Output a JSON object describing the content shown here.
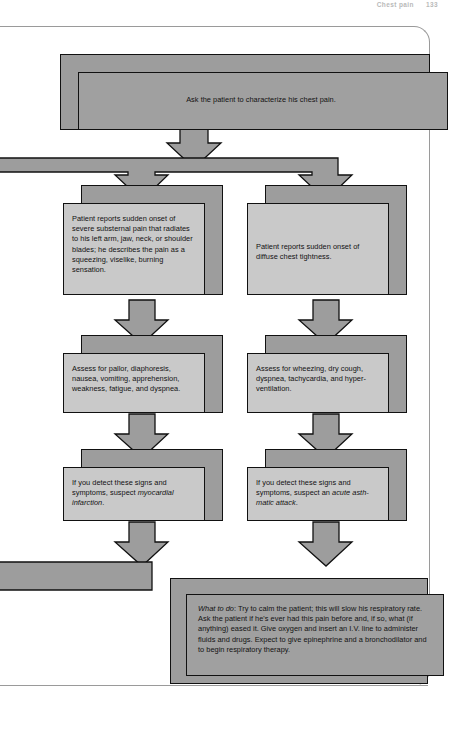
{
  "header": {
    "title": "Chest pain",
    "page_number": "133"
  },
  "flowchart": {
    "type": "decision-flowchart",
    "title": "Chest pain assessment flowchart",
    "nodes": [
      {
        "id": "start",
        "role": "start",
        "column": "full",
        "text": "Ask the patient to characterize his chest pain."
      },
      {
        "id": "left-1",
        "role": "branch-report",
        "column": "left",
        "text": "Patient reports sudden onset of severe substernal pain that radiates to his left arm, jaw, neck, or shoulder blades; he describes the pain as a squeezing, viselike, burning sensation."
      },
      {
        "id": "right-1",
        "role": "branch-report",
        "column": "right",
        "text": "Patient reports sudden onset of diffuse chest tightness."
      },
      {
        "id": "left-2",
        "role": "assess",
        "column": "left",
        "text": "Assess for pallor, diaphoresis, nausea, vomiting, apprehension, weakness, fatigue, and dyspnea."
      },
      {
        "id": "right-2",
        "role": "assess",
        "column": "right",
        "text": "Assess for wheezing, dry cough, dyspnea, tachycardia, and hyper-ventilation."
      },
      {
        "id": "left-3",
        "role": "suspect",
        "column": "left",
        "text_before": "If you detect these signs and symptoms, suspect ",
        "text_italic": "myocardial infarction",
        "text_after": "."
      },
      {
        "id": "right-3",
        "role": "suspect",
        "column": "right",
        "text_before": "If you detect these signs and symptoms, suspect an ",
        "text_italic": "acute asth-matic attack",
        "text_after": "."
      },
      {
        "id": "what-to-do",
        "role": "action",
        "column": "right",
        "text_italic": "What to do",
        "text_after": ": Try to calm the patient; this will slow his respiratory rate. Ask the patient if he's ever had this pain before and, if so, what (if anything) eased it. Give oxygen and insert an I.V. line to administer fluids and drugs. Expect to give epinephrine and a bronchodilator and to begin respiratory therapy."
      }
    ],
    "connectors": [
      {
        "id": "c-start-down",
        "kind": "down-arrow",
        "from": "start",
        "to": "split-bar"
      },
      {
        "id": "c-split",
        "kind": "split-bar",
        "from": "start",
        "to": [
          "left-1",
          "right-1"
        ]
      },
      {
        "id": "c-left-1-2",
        "kind": "down-arrow",
        "from": "left-1",
        "to": "left-2"
      },
      {
        "id": "c-right-1-2",
        "kind": "down-arrow",
        "from": "right-1",
        "to": "right-2"
      },
      {
        "id": "c-left-2-3",
        "kind": "down-arrow",
        "from": "left-2",
        "to": "left-3"
      },
      {
        "id": "c-right-2-3",
        "kind": "down-arrow",
        "from": "right-2",
        "to": "right-3"
      },
      {
        "id": "c-left-3-merge",
        "kind": "down-arrow",
        "from": "left-3",
        "to": "merge-bar"
      },
      {
        "id": "c-right-3-end",
        "kind": "down-arrow",
        "from": "right-3",
        "to": "what-to-do"
      }
    ],
    "colors": {
      "node_fill": "#c9c9c9",
      "shadow_fill": "#9d9d9d",
      "connector_fill": "#9d9d9d",
      "stroke": "#111111",
      "page_background": "#ffffff"
    }
  }
}
